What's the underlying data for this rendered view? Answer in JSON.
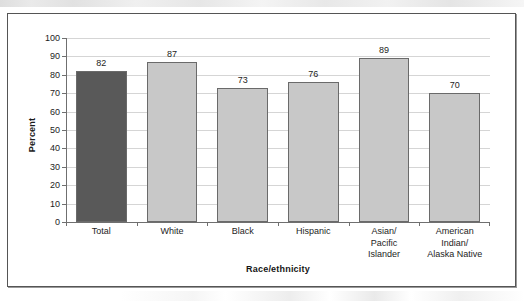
{
  "chart_data": {
    "type": "bar",
    "title": "",
    "xlabel": "Race/ethnicity",
    "ylabel": "Percent",
    "ylim": [
      0,
      100
    ],
    "ytick_step": 10,
    "yticks": [
      0,
      10,
      20,
      30,
      40,
      50,
      60,
      70,
      80,
      90,
      100
    ],
    "grid": true,
    "legend": "none",
    "categories": [
      "Total",
      "White",
      "Black",
      "Hispanic",
      "Asian/ Pacific Islander",
      "American Indian/ Alaska Native"
    ],
    "category_lines": [
      [
        "Total"
      ],
      [
        "White"
      ],
      [
        "Black"
      ],
      [
        "Hispanic"
      ],
      [
        "Asian/",
        "Pacific",
        "Islander"
      ],
      [
        "American",
        "Indian/",
        "Alaska Native"
      ]
    ],
    "values": [
      82,
      87,
      73,
      76,
      89,
      70
    ],
    "value_labels": [
      "82",
      "87",
      "73",
      "76",
      "89",
      "70"
    ],
    "bar_colors": [
      "#595959",
      "#c8c8c8",
      "#c8c8c8",
      "#c8c8c8",
      "#c8c8c8",
      "#c8c8c8"
    ]
  },
  "style": {
    "highlight_bar_color": "#595959",
    "bar_color": "#c8c8c8",
    "bar_border_color": "#6a6a6a",
    "gridline_color": "#d5d5d5",
    "axis_color": "#6f6f6f",
    "frame_color": "#555555",
    "text_color": "#1d1d1d"
  }
}
